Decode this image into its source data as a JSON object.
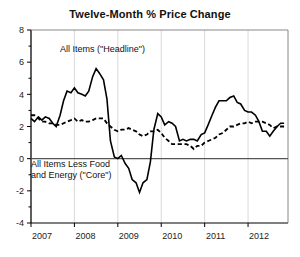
{
  "chart_title": "Twelve-Month % Price Change",
  "annotations": {
    "headline_label": "All Items (\"Headline\")",
    "core_label_line1": "All Items Less Food",
    "core_label_line2": "and Energy (\"Core\")"
  },
  "axis": {
    "y_ticks": [
      "8",
      "6",
      "4",
      "2",
      "0",
      "-2",
      "-4"
    ],
    "x_ticks": [
      "2007",
      "2008",
      "2009",
      "2010",
      "2011",
      "2012"
    ]
  },
  "colors": {
    "line": "#000000",
    "gridline": "#d9d9d9",
    "axis": "#000000",
    "zero_line": "#555555",
    "background": "#ffffff",
    "text": "#111111"
  },
  "chart_data": {
    "type": "line",
    "title": "Twelve-Month % Price Change",
    "xlabel": "",
    "ylabel": "",
    "ylim": [
      -4,
      8
    ],
    "xlim": [
      2007.0,
      2012.92
    ],
    "grid": true,
    "legend": "annotations-inline",
    "y_ticks": [
      -4,
      -2,
      0,
      2,
      4,
      6,
      8
    ],
    "x_ticks": [
      2007,
      2008,
      2009,
      2010,
      2011,
      2012
    ],
    "series": [
      {
        "name": "All Items (\"Headline\")",
        "style": "solid",
        "x": [
          2007.0,
          2007.08,
          2007.17,
          2007.25,
          2007.33,
          2007.42,
          2007.5,
          2007.58,
          2007.67,
          2007.75,
          2007.83,
          2007.92,
          2008.0,
          2008.08,
          2008.17,
          2008.25,
          2008.33,
          2008.42,
          2008.5,
          2008.58,
          2008.67,
          2008.75,
          2008.83,
          2008.92,
          2009.0,
          2009.08,
          2009.17,
          2009.25,
          2009.33,
          2009.42,
          2009.5,
          2009.58,
          2009.67,
          2009.75,
          2009.83,
          2009.92,
          2010.0,
          2010.08,
          2010.17,
          2010.25,
          2010.33,
          2010.42,
          2010.5,
          2010.58,
          2010.67,
          2010.75,
          2010.83,
          2010.92,
          2011.0,
          2011.08,
          2011.17,
          2011.25,
          2011.33,
          2011.42,
          2011.5,
          2011.58,
          2011.67,
          2011.75,
          2011.83,
          2011.92,
          2012.0,
          2012.08,
          2012.17,
          2012.25,
          2012.33,
          2012.42,
          2012.5,
          2012.58,
          2012.67,
          2012.75,
          2012.83
        ],
        "values": [
          2.5,
          2.3,
          2.6,
          2.4,
          2.6,
          2.5,
          2.2,
          2.0,
          2.7,
          3.6,
          4.2,
          4.1,
          4.4,
          4.1,
          4.0,
          3.9,
          4.2,
          5.1,
          5.6,
          5.3,
          4.9,
          3.7,
          1.1,
          0.1,
          0.0,
          0.2,
          -0.3,
          -0.6,
          -1.3,
          -1.5,
          -2.1,
          -1.5,
          -1.3,
          -0.2,
          1.8,
          2.8,
          2.6,
          2.1,
          2.3,
          2.2,
          2.0,
          1.1,
          1.2,
          1.1,
          1.2,
          1.2,
          1.1,
          1.5,
          1.6,
          2.1,
          2.7,
          3.2,
          3.6,
          3.6,
          3.6,
          3.8,
          3.9,
          3.5,
          3.4,
          3.0,
          2.9,
          2.9,
          2.7,
          2.3,
          1.7,
          1.7,
          1.4,
          1.7,
          2.0,
          2.2,
          2.2
        ]
      },
      {
        "name": "All Items Less Food and Energy (\"Core\")",
        "style": "dashed",
        "x": [
          2007.0,
          2007.08,
          2007.17,
          2007.25,
          2007.33,
          2007.42,
          2007.5,
          2007.58,
          2007.67,
          2007.75,
          2007.83,
          2007.92,
          2008.0,
          2008.08,
          2008.17,
          2008.25,
          2008.33,
          2008.42,
          2008.5,
          2008.58,
          2008.67,
          2008.75,
          2008.83,
          2008.92,
          2009.0,
          2009.08,
          2009.17,
          2009.25,
          2009.33,
          2009.42,
          2009.5,
          2009.58,
          2009.67,
          2009.75,
          2009.83,
          2009.92,
          2010.0,
          2010.08,
          2010.17,
          2010.25,
          2010.33,
          2010.42,
          2010.5,
          2010.58,
          2010.67,
          2010.75,
          2010.83,
          2010.92,
          2011.0,
          2011.08,
          2011.17,
          2011.25,
          2011.33,
          2011.42,
          2011.5,
          2011.58,
          2011.67,
          2011.75,
          2011.83,
          2011.92,
          2012.0,
          2012.08,
          2012.17,
          2012.25,
          2012.33,
          2012.42,
          2012.5,
          2012.58,
          2012.67,
          2012.75,
          2012.83
        ],
        "values": [
          2.7,
          2.7,
          2.5,
          2.3,
          2.3,
          2.2,
          2.2,
          2.1,
          2.1,
          2.2,
          2.3,
          2.4,
          2.5,
          2.3,
          2.4,
          2.3,
          2.3,
          2.4,
          2.5,
          2.5,
          2.5,
          2.2,
          2.0,
          1.8,
          1.7,
          1.8,
          1.8,
          1.9,
          1.8,
          1.7,
          1.5,
          1.4,
          1.5,
          1.7,
          1.7,
          1.8,
          1.6,
          1.3,
          1.1,
          0.9,
          0.9,
          0.9,
          0.9,
          0.9,
          0.8,
          0.6,
          0.8,
          0.8,
          1.0,
          1.1,
          1.2,
          1.3,
          1.5,
          1.6,
          1.8,
          2.0,
          2.0,
          2.1,
          2.2,
          2.2,
          2.3,
          2.2,
          2.3,
          2.3,
          2.3,
          2.2,
          2.1,
          1.9,
          2.0,
          2.0,
          2.0
        ]
      }
    ]
  }
}
